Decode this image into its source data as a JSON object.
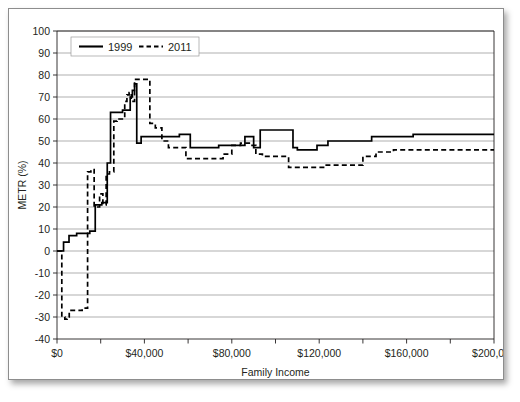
{
  "figure": {
    "name": "metr-family-income-chart"
  },
  "chart_data": {
    "type": "line",
    "title": "",
    "xlabel": "Family Income",
    "ylabel": "METR (%)",
    "xlim": [
      0,
      200000
    ],
    "ylim": [
      -40,
      100
    ],
    "grid": true,
    "grid_axis": "y",
    "legend_position": "top-left",
    "y_ticks": [
      -40,
      -30,
      -20,
      -10,
      0,
      10,
      20,
      30,
      40,
      50,
      60,
      70,
      80,
      90,
      100
    ],
    "y_tick_labels": [
      "-40",
      "-30",
      "-20",
      "-10",
      "0",
      "10",
      "20",
      "30",
      "40",
      "50",
      "60",
      "70",
      "80",
      "90",
      "100"
    ],
    "x_ticks": [
      0,
      20000,
      40000,
      60000,
      80000,
      100000,
      120000,
      140000,
      160000,
      180000,
      200000
    ],
    "x_tick_labels": [
      "$0",
      "",
      "$40,000",
      "",
      "$80,000",
      "",
      "$120,000",
      "",
      "$160,000",
      "",
      "$200,000"
    ],
    "x_major_ticks": [
      0,
      40000,
      80000,
      120000,
      160000,
      200000
    ],
    "series": [
      {
        "name": "1999",
        "style": "solid",
        "color": "#000000",
        "step": "post",
        "points": [
          [
            0,
            0
          ],
          [
            3000,
            0
          ],
          [
            3000,
            4
          ],
          [
            5500,
            4
          ],
          [
            5500,
            7
          ],
          [
            9000,
            7
          ],
          [
            9000,
            8
          ],
          [
            15000,
            8
          ],
          [
            15000,
            9
          ],
          [
            17500,
            9
          ],
          [
            17500,
            21
          ],
          [
            20500,
            21
          ],
          [
            20500,
            22
          ],
          [
            23000,
            22
          ],
          [
            23000,
            40
          ],
          [
            24500,
            40
          ],
          [
            24500,
            63
          ],
          [
            30000,
            63
          ],
          [
            30000,
            64
          ],
          [
            33500,
            64
          ],
          [
            33500,
            70
          ],
          [
            34500,
            70
          ],
          [
            34500,
            73
          ],
          [
            35500,
            73
          ],
          [
            35500,
            76
          ],
          [
            36500,
            76
          ],
          [
            36500,
            49
          ],
          [
            38500,
            49
          ],
          [
            38500,
            52
          ],
          [
            56000,
            52
          ],
          [
            56000,
            53
          ],
          [
            61000,
            53
          ],
          [
            61000,
            47
          ],
          [
            74000,
            47
          ],
          [
            74000,
            48
          ],
          [
            86000,
            48
          ],
          [
            86000,
            52
          ],
          [
            90000,
            52
          ],
          [
            90000,
            47
          ],
          [
            93000,
            47
          ],
          [
            93000,
            55
          ],
          [
            108000,
            55
          ],
          [
            108000,
            47
          ],
          [
            110000,
            47
          ],
          [
            110000,
            46
          ],
          [
            119000,
            46
          ],
          [
            119000,
            48
          ],
          [
            124000,
            48
          ],
          [
            124000,
            50
          ],
          [
            144000,
            50
          ],
          [
            144000,
            52
          ],
          [
            163000,
            52
          ],
          [
            163000,
            53
          ],
          [
            200000,
            53
          ]
        ]
      },
      {
        "name": "2011",
        "style": "dashed",
        "color": "#000000",
        "step": "post",
        "points": [
          [
            0,
            0
          ],
          [
            2200,
            0
          ],
          [
            2200,
            -30
          ],
          [
            3600,
            -30
          ],
          [
            3600,
            -31
          ],
          [
            4600,
            -31
          ],
          [
            4600,
            -30
          ],
          [
            5600,
            -30
          ],
          [
            5600,
            -27
          ],
          [
            11500,
            -27
          ],
          [
            11500,
            -26
          ],
          [
            14000,
            -26
          ],
          [
            14000,
            36
          ],
          [
            15500,
            36
          ],
          [
            15500,
            37
          ],
          [
            17000,
            37
          ],
          [
            17000,
            20
          ],
          [
            19500,
            20
          ],
          [
            19500,
            26
          ],
          [
            21000,
            26
          ],
          [
            21000,
            21
          ],
          [
            22500,
            21
          ],
          [
            22500,
            35
          ],
          [
            24000,
            35
          ],
          [
            24000,
            36
          ],
          [
            26000,
            36
          ],
          [
            26000,
            59
          ],
          [
            27500,
            59
          ],
          [
            27500,
            60
          ],
          [
            31000,
            60
          ],
          [
            31000,
            68
          ],
          [
            32000,
            68
          ],
          [
            32000,
            71
          ],
          [
            33000,
            71
          ],
          [
            33000,
            72
          ],
          [
            34000,
            72
          ],
          [
            34000,
            68
          ],
          [
            35500,
            68
          ],
          [
            35500,
            78
          ],
          [
            42500,
            78
          ],
          [
            42500,
            58
          ],
          [
            45000,
            58
          ],
          [
            45000,
            56
          ],
          [
            48000,
            56
          ],
          [
            48000,
            50
          ],
          [
            51000,
            50
          ],
          [
            51000,
            47
          ],
          [
            59000,
            47
          ],
          [
            59000,
            42
          ],
          [
            76000,
            42
          ],
          [
            76000,
            44
          ],
          [
            80000,
            44
          ],
          [
            80000,
            48
          ],
          [
            84000,
            48
          ],
          [
            84000,
            49
          ],
          [
            88000,
            49
          ],
          [
            88000,
            48
          ],
          [
            91000,
            48
          ],
          [
            91000,
            44
          ],
          [
            94000,
            44
          ],
          [
            94000,
            43
          ],
          [
            106000,
            43
          ],
          [
            106000,
            38
          ],
          [
            122000,
            38
          ],
          [
            122000,
            39
          ],
          [
            140000,
            39
          ],
          [
            140000,
            43
          ],
          [
            146000,
            43
          ],
          [
            146000,
            45
          ],
          [
            154000,
            45
          ],
          [
            154000,
            46
          ],
          [
            200000,
            46
          ]
        ]
      }
    ],
    "legend_entries": [
      {
        "label": "1999",
        "style": "solid"
      },
      {
        "label": "2011",
        "style": "dashed"
      }
    ]
  }
}
